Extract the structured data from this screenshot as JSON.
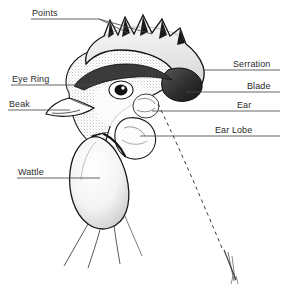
{
  "diagram": {
    "background_color": "#ffffff",
    "ink_color": "#2b2b2b",
    "labels": [
      {
        "id": "points",
        "text": "Points",
        "x": 32,
        "y": 8,
        "side": "left"
      },
      {
        "id": "eye-ring",
        "text": "Eye Ring",
        "x": 12,
        "y": 74,
        "side": "left"
      },
      {
        "id": "beak",
        "text": "Beak",
        "x": 9,
        "y": 99,
        "side": "left"
      },
      {
        "id": "wattle",
        "text": "Wattle",
        "x": 18,
        "y": 167,
        "side": "left"
      },
      {
        "id": "serration",
        "text": "Serration",
        "x": 233,
        "y": 59,
        "side": "right"
      },
      {
        "id": "blade",
        "text": "Blade",
        "x": 247,
        "y": 81,
        "side": "right"
      },
      {
        "id": "ear",
        "text": "Ear",
        "x": 237,
        "y": 100,
        "side": "right"
      },
      {
        "id": "ear-lobe",
        "text": "Ear Lobe",
        "x": 215,
        "y": 125,
        "side": "right"
      }
    ]
  }
}
